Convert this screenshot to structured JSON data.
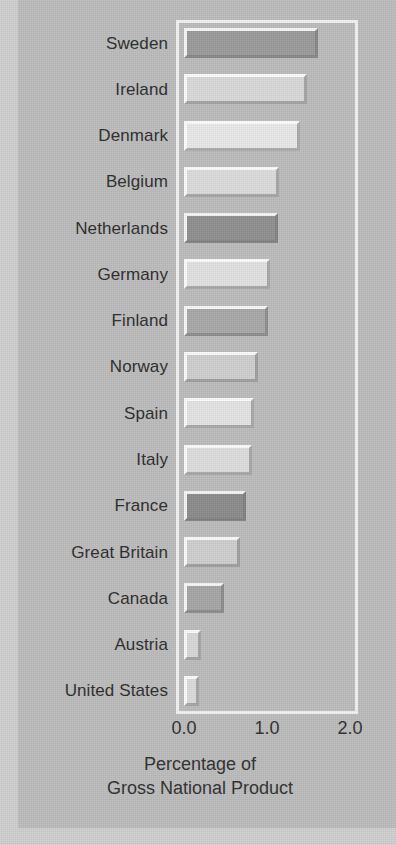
{
  "chart_data": {
    "type": "bar",
    "orientation": "horizontal",
    "title": "",
    "xlabel": "Percentage of Gross National Product",
    "ylabel": "",
    "xlim": [
      0.0,
      2.0
    ],
    "xticks": [
      "0.0",
      "1.0",
      "2.0"
    ],
    "xtick_values": [
      0.0,
      1.0,
      2.0
    ],
    "grid": false,
    "legend": null,
    "categories": [
      "Sweden",
      "Ireland",
      "Denmark",
      "Belgium",
      "Netherlands",
      "Germany",
      "Finland",
      "Norway",
      "Spain",
      "Italy",
      "France",
      "Great Britain",
      "Canada",
      "Austria",
      "United States"
    ],
    "values": [
      1.61,
      1.48,
      1.4,
      1.14,
      1.13,
      1.04,
      1.01,
      0.89,
      0.84,
      0.82,
      0.75,
      0.67,
      0.48,
      0.2,
      0.18
    ],
    "bar_fills": [
      "#9a9a9a",
      "#d9d9d9",
      "#e9e9e9",
      "#dcdcdc",
      "#8f8f8f",
      "#e2e2e2",
      "#a8a8a8",
      "#cfcfcf",
      "#e4e4e4",
      "#dedede",
      "#8b8b8b",
      "#cfcfcf",
      "#a5a5a5",
      "#d8d8d8",
      "#dcdcdc"
    ]
  },
  "axis": {
    "caption_line_1": "Percentage of",
    "caption_line_2": "Gross National Product"
  },
  "colors": {
    "background": "#bfbfbf",
    "mat": "#cfcfcf",
    "frame": "#f2f2f2",
    "text": "#2a2a2a"
  }
}
